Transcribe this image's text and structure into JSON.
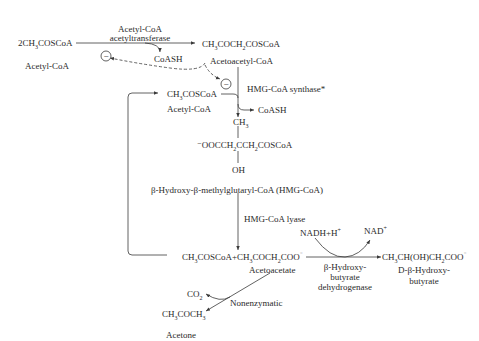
{
  "diagram": {
    "nodes": {
      "acetyl_coa_formula": {
        "prefix": "2CH",
        "sub": "3",
        "suffix": "COSCoA"
      },
      "acetyl_coa_name": "Acetyl-CoA",
      "acetoacetyl_coa_formula": {
        "a": "CH",
        "s1": "3",
        "b": "COCH",
        "s2": "2",
        "c": "COSCoA"
      },
      "acetoacetyl_coa_name": "Acetoacetyl-CoA",
      "acetyl_coa2_formula": {
        "a": "CH",
        "s1": "3",
        "b": "COSCoA"
      },
      "acetyl_coa2_name": "Acetyl-CoA",
      "hmg_ch3": {
        "a": "CH",
        "s1": "3"
      },
      "hmg_formula": {
        "a": "⁻OOCCH",
        "s1": "2",
        "b": "CCH",
        "s2": "2",
        "c": "COSCoA"
      },
      "hmg_oh": "OH",
      "hmg_name": "β-Hydroxy-β-methylglutaryl-CoA (HMG-CoA)",
      "products_formula": {
        "a": "CH",
        "s1": "3",
        "b": "COSCoA+CH",
        "s2": "3",
        "c": "COCH",
        "s3": "2",
        "d": "COO",
        "sup": "⁻"
      },
      "acetoacetate_name": "Acetoacetate",
      "hydroxybutyrate_formula": {
        "a": "CH",
        "s1": "3",
        "b": "CH(OH)CH",
        "s2": "2",
        "c": "COO",
        "sup": "⁻"
      },
      "hydroxybutyrate_name_line1": "D-β-Hydroxy-",
      "hydroxybutyrate_name_line2": "butyrate",
      "co2": {
        "a": "CO",
        "s1": "2"
      },
      "acetone_formula": {
        "a": "CH",
        "s1": "3",
        "b": "COCH",
        "s2": "3"
      },
      "acetone_name": "Acetone"
    },
    "enzymes": {
      "thiolase_line1": "Acetyl-CoA",
      "thiolase_line2": "acetyltransferase",
      "hmg_synthase": "HMG-CoA synthase*",
      "hmg_lyase": "HMG-CoA lyase",
      "bhbdh_line1": "β-Hydroxy-",
      "bhbdh_line2": "butyrate",
      "bhbdh_line3": "dehydrogenase",
      "nonenzymatic": "Nonenzymatic"
    },
    "cofactors": {
      "coash_1": "CoASH",
      "coash_2": "CoASH",
      "nadh": {
        "a": "NADH+H",
        "sup": "+"
      },
      "nad": {
        "a": "NAD",
        "sup": "+"
      }
    },
    "inhibition_symbol": "−",
    "colors": {
      "line": "#3a3a3a",
      "text": "#2a2a2a",
      "background": "#ffffff"
    }
  }
}
